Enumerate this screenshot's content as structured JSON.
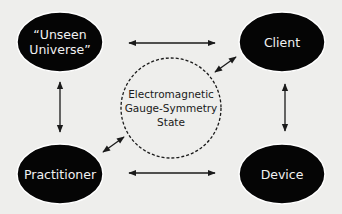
{
  "diagram": {
    "nodes": [
      {
        "id": "unseen-universe",
        "label": "“Unseen\nUniverse”"
      },
      {
        "id": "client",
        "label": "Client"
      },
      {
        "id": "practitioner",
        "label": "Practitioner"
      },
      {
        "id": "device",
        "label": "Device"
      }
    ],
    "center": {
      "label": "Electromagnetic\nGauge-Symmetry\nState"
    },
    "edges": [
      {
        "from": "client",
        "to": "unseen-universe",
        "style": "solid",
        "direction": "bidirectional"
      },
      {
        "from": "unseen-universe",
        "to": "practitioner",
        "style": "solid",
        "direction": "bidirectional"
      },
      {
        "from": "client",
        "to": "device",
        "style": "solid",
        "direction": "bidirectional"
      },
      {
        "from": "practitioner",
        "to": "device",
        "style": "solid",
        "direction": "bidirectional"
      },
      {
        "from": "center",
        "to": "client",
        "style": "dashed",
        "direction": "bidirectional"
      },
      {
        "from": "center",
        "to": "practitioner",
        "style": "dashed",
        "direction": "bidirectional"
      }
    ],
    "colors": {
      "background": "#eeeeec",
      "node_fill": "#050505",
      "node_text": "#f2f2f2",
      "line": "#1a1a1a"
    }
  }
}
